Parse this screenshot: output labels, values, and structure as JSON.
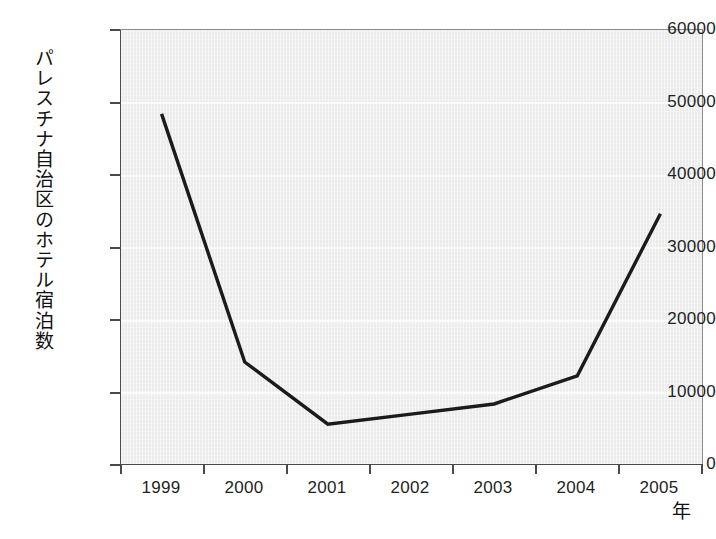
{
  "chart_data": {
    "type": "line",
    "title": "",
    "subtitle": "",
    "xlabel": "年",
    "ylabel": "パレスチナ自治区のホテル宿泊数",
    "categories": [
      "1999",
      "2000",
      "2001",
      "2002",
      "2003",
      "2004",
      "2005"
    ],
    "x": [
      1999,
      2000,
      2001,
      2002,
      2003,
      2004,
      2005
    ],
    "series": [
      {
        "name": "パレスチナ自治区のホテル宿泊数",
        "values": [
          48400,
          14100,
          5500,
          6900,
          8300,
          12200,
          34600
        ]
      }
    ],
    "ylim": [
      0,
      60000
    ],
    "yticks": [
      0,
      10000,
      20000,
      30000,
      40000,
      50000,
      60000
    ],
    "ytick_labels": [
      "0",
      "10000",
      "20000",
      "30000",
      "40000",
      "50000",
      "60000"
    ],
    "xtick_labels": [
      "1999",
      "2000",
      "2001",
      "2002",
      "2003",
      "2004",
      "2005"
    ],
    "grid": true,
    "grid_axis": "y",
    "legend": false,
    "legend_position": "none",
    "line_color": "#1b1b1b",
    "plot_background": "#ebebeb",
    "figure_background": "#ffffff",
    "axis_color": "#4a4a4a"
  },
  "axes": {
    "y": {
      "title": "パレスチナ自治区のホテル宿泊数",
      "ticks": [
        {
          "label": "60000",
          "value": 60000
        },
        {
          "label": "50000",
          "value": 50000
        },
        {
          "label": "40000",
          "value": 40000
        },
        {
          "label": "30000",
          "value": 30000
        },
        {
          "label": "20000",
          "value": 20000
        },
        {
          "label": "10000",
          "value": 10000
        },
        {
          "label": "0",
          "value": 0
        }
      ]
    },
    "x": {
      "title": "年",
      "ticks": [
        {
          "label": "1999",
          "value": 1999
        },
        {
          "label": "2000",
          "value": 2000
        },
        {
          "label": "2001",
          "value": 2001
        },
        {
          "label": "2002",
          "value": 2002
        },
        {
          "label": "2003",
          "value": 2003
        },
        {
          "label": "2004",
          "value": 2004
        },
        {
          "label": "2005",
          "value": 2005
        }
      ]
    }
  }
}
